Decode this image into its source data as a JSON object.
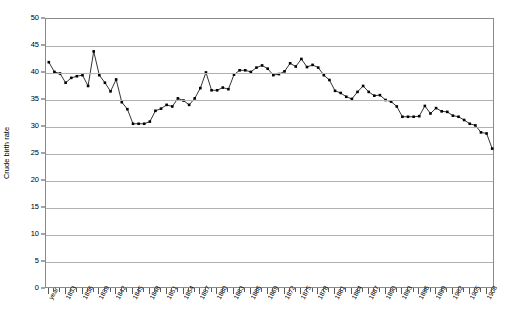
{
  "chart_data": {
    "type": "line",
    "title": "",
    "xlabel": "year",
    "ylabel": "Crude birth rate",
    "ylim": [
      0,
      50
    ],
    "ytick_step": 5,
    "yticks": [
      0,
      5,
      10,
      15,
      20,
      25,
      30,
      35,
      40,
      45,
      50
    ],
    "grid": true,
    "legend": "none",
    "marker": "square",
    "line_color": "#000000",
    "marker_color": "#000000",
    "grid_color": "#b0b0b0",
    "axis_color": "#8a8a8a",
    "x_first_label": "year",
    "xtick_label_step": 3,
    "xtick_labels": [
      "year",
      "1833",
      "1836",
      "1839",
      "1842",
      "1845",
      "1848",
      "1851",
      "1854",
      "1857",
      "1860",
      "1863",
      "1866",
      "1869",
      "1872",
      "1875",
      "1878",
      "1881",
      "1884",
      "1887",
      "1890",
      "1893",
      "1896",
      "1899",
      "1902",
      "1905",
      "1908"
    ],
    "x": [
      1830,
      1831,
      1832,
      1833,
      1834,
      1835,
      1836,
      1837,
      1838,
      1839,
      1840,
      1841,
      1842,
      1843,
      1844,
      1845,
      1846,
      1847,
      1848,
      1849,
      1850,
      1851,
      1852,
      1853,
      1854,
      1855,
      1856,
      1857,
      1858,
      1859,
      1860,
      1861,
      1862,
      1863,
      1864,
      1865,
      1866,
      1867,
      1868,
      1869,
      1870,
      1871,
      1872,
      1873,
      1874,
      1875,
      1876,
      1877,
      1878,
      1879,
      1880,
      1881,
      1882,
      1883,
      1884,
      1885,
      1886,
      1887,
      1888,
      1889,
      1890,
      1891,
      1892,
      1893,
      1894,
      1895,
      1896,
      1897,
      1898,
      1899,
      1900,
      1901,
      1902,
      1903,
      1904,
      1905,
      1906,
      1907,
      1908,
      1909
    ],
    "categories": [
      "1830",
      "1831",
      "1832",
      "1833",
      "1834",
      "1835",
      "1836",
      "1837",
      "1838",
      "1839",
      "1840",
      "1841",
      "1842",
      "1843",
      "1844",
      "1845",
      "1846",
      "1847",
      "1848",
      "1849",
      "1850",
      "1851",
      "1852",
      "1853",
      "1854",
      "1855",
      "1856",
      "1857",
      "1858",
      "1859",
      "1860",
      "1861",
      "1862",
      "1863",
      "1864",
      "1865",
      "1866",
      "1867",
      "1868",
      "1869",
      "1870",
      "1871",
      "1872",
      "1873",
      "1874",
      "1875",
      "1876",
      "1877",
      "1878",
      "1879",
      "1880",
      "1881",
      "1882",
      "1883",
      "1884",
      "1885",
      "1886",
      "1887",
      "1888",
      "1889",
      "1890",
      "1891",
      "1892",
      "1893",
      "1894",
      "1895",
      "1896",
      "1897",
      "1898",
      "1899",
      "1900",
      "1901",
      "1902",
      "1903",
      "1904",
      "1905",
      "1906",
      "1907",
      "1908",
      "1909"
    ],
    "values": [
      42.0,
      40.2,
      39.9,
      38.2,
      39.1,
      39.4,
      39.6,
      37.6,
      44.0,
      39.6,
      38.2,
      36.6,
      38.8,
      34.6,
      33.3,
      30.6,
      30.6,
      30.6,
      31.0,
      33.0,
      33.4,
      34.1,
      33.8,
      35.3,
      34.9,
      34.1,
      35.3,
      37.2,
      40.1,
      36.8,
      36.8,
      37.3,
      37.0,
      39.7,
      40.5,
      40.5,
      40.2,
      41.0,
      41.4,
      40.8,
      39.6,
      39.8,
      40.3,
      41.8,
      41.2,
      42.6,
      41.1,
      41.5,
      41.0,
      39.6,
      38.7,
      36.7,
      36.3,
      35.6,
      35.2,
      36.5,
      37.6,
      36.5,
      35.8,
      35.9,
      35.0,
      34.7,
      33.8,
      31.9,
      31.9,
      31.9,
      32.0,
      33.9,
      32.5,
      33.5,
      32.9,
      32.8,
      32.1,
      31.9,
      31.3,
      30.6,
      30.3,
      29.0,
      28.8,
      26.0
    ],
    "series": [
      {
        "name": "Crude birth rate",
        "values": [
          42.0,
          40.2,
          39.9,
          38.2,
          39.1,
          39.4,
          39.6,
          37.6,
          44.0,
          39.6,
          38.2,
          36.6,
          38.8,
          34.6,
          33.3,
          30.6,
          30.6,
          30.6,
          31.0,
          33.0,
          33.4,
          34.1,
          33.8,
          35.3,
          34.9,
          34.1,
          35.3,
          37.2,
          40.1,
          36.8,
          36.8,
          37.3,
          37.0,
          39.7,
          40.5,
          40.5,
          40.2,
          41.0,
          41.4,
          40.8,
          39.6,
          39.8,
          40.3,
          41.8,
          41.2,
          42.6,
          41.1,
          41.5,
          41.0,
          39.6,
          38.7,
          36.7,
          36.3,
          35.6,
          35.2,
          36.5,
          37.6,
          36.5,
          35.8,
          35.9,
          35.0,
          34.7,
          33.8,
          31.9,
          31.9,
          31.9,
          32.0,
          33.9,
          32.5,
          33.5,
          32.9,
          32.8,
          32.1,
          31.9,
          31.3,
          30.6,
          30.3,
          29.0,
          28.8,
          26.0
        ]
      }
    ]
  }
}
